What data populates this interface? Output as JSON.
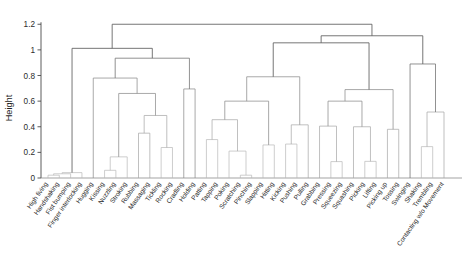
{
  "chart_data": {
    "type": "dendrogram",
    "title": "",
    "subtitle": "",
    "xlabel": "",
    "ylabel": "Height",
    "ylim": [
      0,
      1.28
    ],
    "grid": false,
    "legend": null,
    "y_ticks": [
      0,
      0.2,
      0.4,
      0.6,
      0.8,
      1,
      1.2
    ],
    "y_tick_labels": [
      "0",
      "0.2",
      "0.4",
      "0.6",
      "0.8",
      "1",
      "1.2"
    ],
    "leaf_labels": [
      "High fiving",
      "Handshaking",
      "Fist bumping",
      "Finger interlocking",
      "Hugging",
      "Kissing",
      "Nuzzling",
      "Stroking",
      "Rubbing",
      "Massaging",
      "Tickling",
      "Rocking",
      "Cradling",
      "Holding",
      "Patting",
      "Tapping",
      "Poking",
      "Scratching",
      "Pinching",
      "Slapping",
      "Hitting",
      "Kicking",
      "Pushing",
      "Pulling",
      "Grabbing",
      "Pressing",
      "Squeezing",
      "Squashing",
      "Picking",
      "Lifting",
      "Picking up",
      "Tossing",
      "Swinging",
      "Shaking",
      "Trembling",
      "Contacting w/o Movement"
    ],
    "leaf_count": 36,
    "merges": [
      {
        "id": "m1",
        "left": "leaf:0",
        "right": "leaf:1",
        "height": 0.022
      },
      {
        "id": "m2",
        "left": "m1",
        "right": "leaf:2",
        "height": 0.033
      },
      {
        "id": "m3",
        "left": "m2",
        "right": "leaf:3",
        "height": 0.042
      },
      {
        "id": "m4",
        "left": "leaf:5",
        "right": "leaf:6",
        "height": 0.06
      },
      {
        "id": "m5",
        "left": "m4",
        "right": "leaf:7",
        "height": 0.165
      },
      {
        "id": "m6",
        "left": "leaf:8",
        "right": "leaf:9",
        "height": 0.35
      },
      {
        "id": "m7",
        "left": "leaf:10",
        "right": "leaf:11",
        "height": 0.238
      },
      {
        "id": "m8",
        "left": "m6",
        "right": "m7",
        "height": 0.488
      },
      {
        "id": "m9",
        "left": "m5",
        "right": "m8",
        "height": 0.66
      },
      {
        "id": "m10",
        "left": "leaf:4",
        "right": "m9",
        "height": 0.78
      },
      {
        "id": "m11",
        "left": "leaf:12",
        "right": "leaf:13",
        "height": 0.695
      },
      {
        "id": "m12",
        "left": "m10",
        "right": "m11",
        "height": 0.935
      },
      {
        "id": "m13",
        "left": "m3",
        "right": "m12",
        "height": 1.012
      },
      {
        "id": "m14",
        "left": "leaf:14",
        "right": "leaf:15",
        "height": 0.3
      },
      {
        "id": "m15",
        "left": "leaf:17",
        "right": "leaf:18",
        "height": 0.022
      },
      {
        "id": "m16",
        "left": "leaf:16",
        "right": "m15",
        "height": 0.21
      },
      {
        "id": "m17",
        "left": "m14",
        "right": "m16",
        "height": 0.455
      },
      {
        "id": "m18",
        "left": "leaf:19",
        "right": "leaf:20",
        "height": 0.258
      },
      {
        "id": "m19",
        "left": "m17",
        "right": "m18",
        "height": 0.6
      },
      {
        "id": "m20",
        "left": "leaf:21",
        "right": "leaf:22",
        "height": 0.265
      },
      {
        "id": "m21",
        "left": "m20",
        "right": "leaf:23",
        "height": 0.415
      },
      {
        "id": "m22",
        "left": "m19",
        "right": "m21",
        "height": 0.79
      },
      {
        "id": "m23",
        "left": "leaf:25",
        "right": "leaf:26",
        "height": 0.128
      },
      {
        "id": "m24",
        "left": "leaf:24",
        "right": "m23",
        "height": 0.405
      },
      {
        "id": "m25",
        "left": "leaf:28",
        "right": "leaf:29",
        "height": 0.13
      },
      {
        "id": "m26",
        "left": "leaf:27",
        "right": "m25",
        "height": 0.4
      },
      {
        "id": "m27",
        "left": "m24",
        "right": "m26",
        "height": 0.6
      },
      {
        "id": "m28",
        "left": "leaf:30",
        "right": "leaf:31",
        "height": 0.38
      },
      {
        "id": "m29",
        "left": "m27",
        "right": "m28",
        "height": 0.69
      },
      {
        "id": "m30",
        "left": "m22",
        "right": "m29",
        "height": 1.055
      },
      {
        "id": "m31",
        "left": "leaf:33",
        "right": "leaf:34",
        "height": 0.245
      },
      {
        "id": "m32",
        "left": "m31",
        "right": "leaf:35",
        "height": 0.515
      },
      {
        "id": "m33",
        "left": "leaf:32",
        "right": "m32",
        "height": 0.89
      },
      {
        "id": "m34",
        "left": "m30",
        "right": "m33",
        "height": 1.11
      },
      {
        "id": "m35",
        "left": "m13",
        "right": "m34",
        "height": 1.2
      }
    ],
    "root": "m35",
    "line_color": "#6b6b6b",
    "axis_color": "#4a4a4a"
  },
  "axis": {
    "y_label": "Height"
  }
}
